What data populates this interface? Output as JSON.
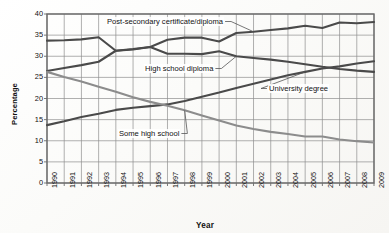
{
  "chart_data": {
    "type": "line",
    "title": "",
    "xlabel": "Year",
    "ylabel": "Percentage",
    "ylim": [
      0,
      40
    ],
    "ytick_step": 5,
    "yticks": [
      0,
      5,
      10,
      15,
      20,
      25,
      30,
      35,
      40
    ],
    "grid": true,
    "legend_position": "inline-annotations",
    "categories": [
      "1990",
      "1991",
      "1992",
      "1993",
      "1994",
      "1995",
      "1996",
      "1997",
      "1998",
      "1999",
      "2000",
      "2001",
      "2002",
      "2003",
      "2004",
      "2005",
      "2006",
      "2007",
      "2008",
      "2009"
    ],
    "series": [
      {
        "name": "Post-secondary certificate/diploma",
        "color": "#4a4a4a",
        "values": [
          33.7,
          33.8,
          34.0,
          34.5,
          31.3,
          31.7,
          32.2,
          33.9,
          34.4,
          34.4,
          33.5,
          35.5,
          35.8,
          36.2,
          36.6,
          37.2,
          36.7,
          38.0,
          37.8,
          38.1
        ]
      },
      {
        "name": "High school diploma",
        "color": "#4a4a4a",
        "values": [
          26.5,
          27.2,
          27.9,
          28.7,
          31.3,
          31.6,
          32.2,
          30.6,
          30.6,
          30.5,
          31.2,
          30.0,
          29.6,
          29.2,
          28.7,
          28.1,
          27.5,
          27.0,
          26.6,
          26.3
        ]
      },
      {
        "name": "University degree",
        "color": "#4a4a4a",
        "values": [
          13.7,
          14.6,
          15.6,
          16.4,
          17.3,
          17.8,
          18.2,
          18.6,
          19.4,
          20.4,
          21.4,
          22.5,
          23.5,
          24.5,
          25.5,
          26.3,
          27.1,
          27.6,
          28.3,
          28.8
        ]
      },
      {
        "name": "Some high school",
        "color": "#8c8c8c",
        "values": [
          26.3,
          25.1,
          24.0,
          22.8,
          21.6,
          20.3,
          19.2,
          18.3,
          17.2,
          16.0,
          14.8,
          13.6,
          12.8,
          12.1,
          11.6,
          11.0,
          11.0,
          10.3,
          9.9,
          9.6
        ]
      }
    ],
    "annotations": [
      {
        "text": "Post-secondary certificate/diploma",
        "target_year": "2002",
        "target_value": 35.8
      },
      {
        "text": "High school diploma",
        "target_year": "2001",
        "target_value": 30.0
      },
      {
        "text": "University degree",
        "target_year": "2005",
        "target_value": 26.3
      },
      {
        "text": "Some high school",
        "target_year": "1998",
        "target_value": 17.2
      }
    ]
  },
  "axis": {
    "y_title": "Percentage",
    "x_title": "Year",
    "y_ticks": [
      "40",
      "35",
      "30",
      "25",
      "20",
      "15",
      "10",
      "5",
      "0"
    ],
    "x_ticks": [
      "1990",
      "1991",
      "1992",
      "1993",
      "1994",
      "1995",
      "1996",
      "1997",
      "1998",
      "1999",
      "2000",
      "2001",
      "2002",
      "2003",
      "2004",
      "2005",
      "2006",
      "2007",
      "2008",
      "2009"
    ]
  },
  "labels": {
    "post_secondary": "Post-secondary certificate/diploma",
    "high_school_diploma": "High school diploma",
    "university_degree": "University degree",
    "some_high_school": "Some high school"
  },
  "colors": {
    "dark_line": "#4a4a4a",
    "light_line": "#8c8c8c",
    "grid": "#8e8e8e",
    "frame": "#6a6a6a",
    "text": "#111111"
  }
}
